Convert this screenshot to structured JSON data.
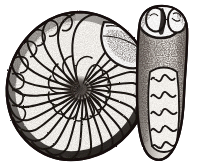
{
  "plate": {
    "background_color": "#ffffff",
    "ink_color": "#1a1512",
    "mid_tone_color": "#4a4038",
    "light_tone_color": "#9a9088",
    "highlight_color": "#f2efe9",
    "width_px": 197,
    "height_px": 166,
    "subject": "ammonite-fossil",
    "technique": "engraving",
    "caption": ""
  },
  "figures": [
    {
      "id": "lateral-view",
      "name": "ammonite-lateral-view",
      "label": "",
      "description": "coiled planispiral ammonite shell, left lateral view",
      "center_x": 78,
      "center_y": 88,
      "outer_radius_x": 72,
      "outer_radius_y": 76,
      "whorl_count": 3,
      "suture_rib_count": 26,
      "aperture_position": "upper-right",
      "umbilicus_shading": "dark"
    },
    {
      "id": "ventral-view",
      "name": "ammonite-ventral-view",
      "label": "",
      "description": "ventral / apertural view of same ammonite showing paired lobes and zigzag suture bands",
      "center_x": 162,
      "top_y": 6,
      "bottom_y": 160,
      "width_px": 56,
      "lobe_count": 2,
      "zigzag_band_count": 5
    }
  ]
}
